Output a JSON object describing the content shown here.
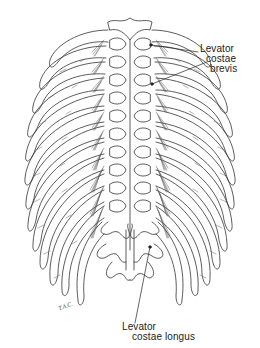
{
  "figure": {
    "colors": {
      "line": "#333333",
      "hatch": "#555555",
      "background": "#ffffff"
    }
  },
  "labels": {
    "brevis": {
      "line1": "Levator",
      "line2": "costae",
      "line3": "brevis"
    },
    "longus": {
      "line1": "Levator",
      "line2": "costae longus"
    }
  },
  "signature": "T.A.C."
}
